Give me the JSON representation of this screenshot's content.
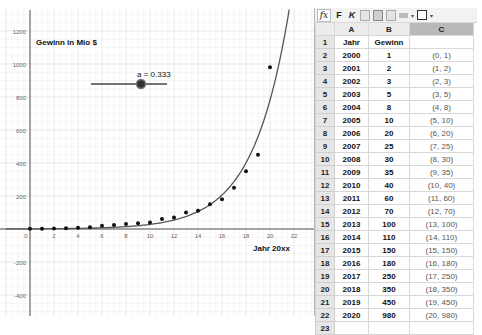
{
  "graphics": {
    "title_label": "Gewinn in Mio $",
    "x_axis_label": "Jahr 20xx",
    "slider": {
      "name": "a",
      "value": 0.333,
      "label": "a = 0.333",
      "min": 0,
      "max": 1
    },
    "x_ticks": [
      "0",
      "2",
      "4",
      "6",
      "8",
      "10",
      "12",
      "14",
      "16",
      "18",
      "20",
      "22"
    ],
    "y_ticks": [
      "1200",
      "1000",
      "800",
      "600",
      "400",
      "200",
      "-200",
      "-400"
    ],
    "curve": "f(x) = e^(a·x)"
  },
  "toolbar": {
    "fx_label": "fx",
    "bold_label": "F",
    "italic_label": "K",
    "color_caret": "▾",
    "border_caret": "▾"
  },
  "spreadsheet": {
    "columns": [
      "A",
      "B",
      "C"
    ],
    "selected_column": "C",
    "rows": [
      {
        "n": "1",
        "a": "Jahr",
        "b": "Gewinn",
        "c": ""
      },
      {
        "n": "2",
        "a": "2000",
        "b": "1",
        "c": "(0, 1)"
      },
      {
        "n": "3",
        "a": "2001",
        "b": "2",
        "c": "(1, 2)"
      },
      {
        "n": "4",
        "a": "2002",
        "b": "3",
        "c": "(2, 3)"
      },
      {
        "n": "5",
        "a": "2003",
        "b": "5",
        "c": "(3, 5)"
      },
      {
        "n": "6",
        "a": "2004",
        "b": "8",
        "c": "(4, 8)"
      },
      {
        "n": "7",
        "a": "2005",
        "b": "10",
        "c": "(5, 10)"
      },
      {
        "n": "8",
        "a": "2006",
        "b": "20",
        "c": "(6, 20)"
      },
      {
        "n": "9",
        "a": "2007",
        "b": "25",
        "c": "(7, 25)"
      },
      {
        "n": "10",
        "a": "2008",
        "b": "30",
        "c": "(8, 30)"
      },
      {
        "n": "11",
        "a": "2009",
        "b": "35",
        "c": "(9, 35)"
      },
      {
        "n": "12",
        "a": "2010",
        "b": "40",
        "c": "(10, 40)"
      },
      {
        "n": "13",
        "a": "2011",
        "b": "60",
        "c": "(11, 60)"
      },
      {
        "n": "14",
        "a": "2012",
        "b": "70",
        "c": "(12, 70)"
      },
      {
        "n": "15",
        "a": "2013",
        "b": "100",
        "c": "(13, 100)"
      },
      {
        "n": "16",
        "a": "2014",
        "b": "110",
        "c": "(14, 110)"
      },
      {
        "n": "17",
        "a": "2015",
        "b": "150",
        "c": "(15, 150)"
      },
      {
        "n": "18",
        "a": "2016",
        "b": "180",
        "c": "(16, 180)"
      },
      {
        "n": "19",
        "a": "2017",
        "b": "250",
        "c": "(17, 250)"
      },
      {
        "n": "20",
        "a": "2018",
        "b": "350",
        "c": "(18, 350)"
      },
      {
        "n": "21",
        "a": "2019",
        "b": "450",
        "c": "(19, 450)"
      },
      {
        "n": "22",
        "a": "2020",
        "b": "980",
        "c": "(20, 980)"
      },
      {
        "n": "23",
        "a": "",
        "b": "",
        "c": ""
      }
    ]
  },
  "points": [
    [
      0,
      1
    ],
    [
      1,
      2
    ],
    [
      2,
      3
    ],
    [
      3,
      5
    ],
    [
      4,
      8
    ],
    [
      5,
      10
    ],
    [
      6,
      20
    ],
    [
      7,
      25
    ],
    [
      8,
      30
    ],
    [
      9,
      35
    ],
    [
      10,
      40
    ],
    [
      11,
      60
    ],
    [
      12,
      70
    ],
    [
      13,
      100
    ],
    [
      14,
      110
    ],
    [
      15,
      150
    ],
    [
      16,
      180
    ],
    [
      17,
      250
    ],
    [
      18,
      350
    ],
    [
      19,
      450
    ],
    [
      20,
      980
    ]
  ]
}
